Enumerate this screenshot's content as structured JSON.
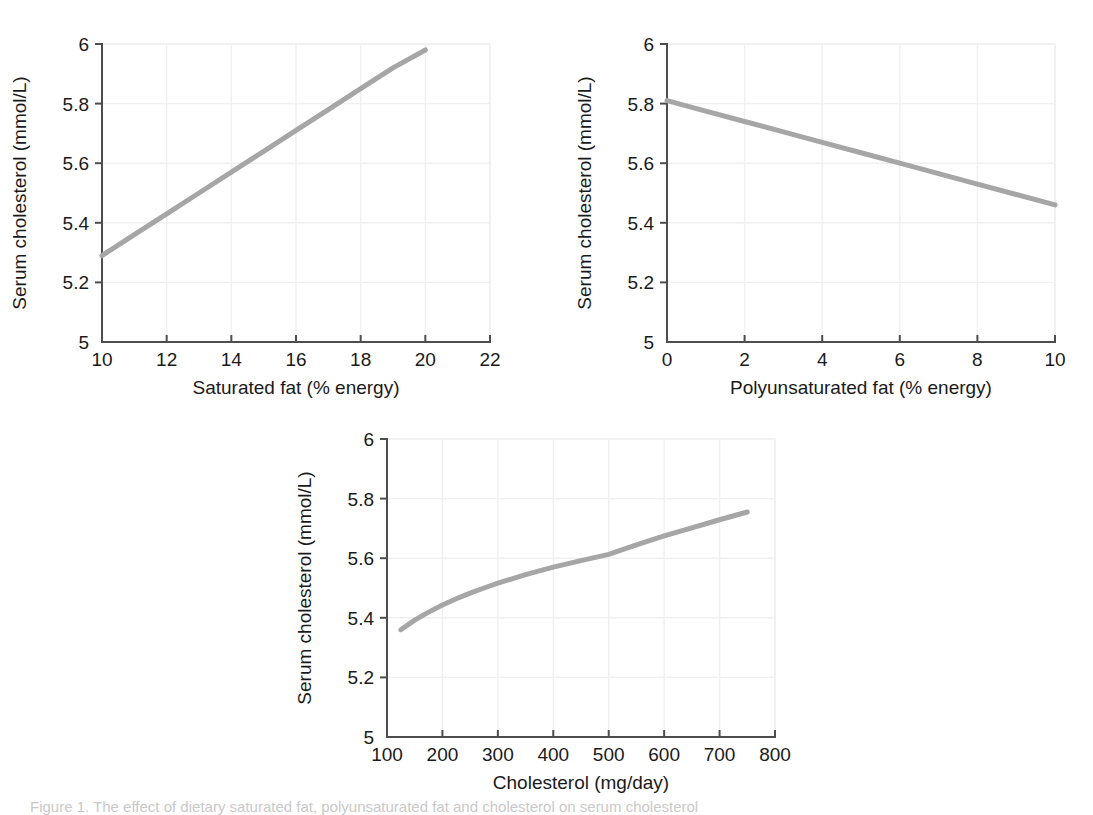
{
  "figure": {
    "background": "#ffffff",
    "line_color": "#a6a6a6",
    "grid_color": "#f0f0f0",
    "axis_color": "#4d4d4d",
    "caption": "Figure 1. The effect of dietary saturated fat, polyunsaturated fat and cholesterol on serum cholesterol"
  },
  "chart_data": [
    {
      "type": "line",
      "panel": "a",
      "title": "",
      "xlabel": "Saturated fat (% energy)",
      "ylabel": "Serum cholesterol (mmol/L)",
      "xlim": [
        10,
        22
      ],
      "ylim": [
        5,
        6
      ],
      "xticks": [
        10,
        12,
        14,
        16,
        18,
        20,
        22
      ],
      "xticklabels": [
        "10",
        "12",
        "14",
        "16",
        "18",
        "20",
        "22"
      ],
      "yticks": [
        5,
        5.2,
        5.4,
        5.6,
        5.8,
        6
      ],
      "yticklabels": [
        "5",
        "5.2",
        "5.4",
        "5.6",
        "5.8",
        "6"
      ],
      "grid": true,
      "legend": "none",
      "x": [
        10,
        11,
        12,
        13,
        14,
        15,
        16,
        17,
        18,
        19,
        20
      ],
      "values": [
        5.29,
        5.36,
        5.43,
        5.5,
        5.57,
        5.64,
        5.71,
        5.78,
        5.85,
        5.92,
        5.98
      ]
    },
    {
      "type": "line",
      "panel": "b",
      "title": "",
      "xlabel": "Polyunsaturated fat (% energy)",
      "ylabel": "Serum cholesterol (mmol/L)",
      "xlim": [
        0,
        10
      ],
      "ylim": [
        5,
        6
      ],
      "xticks": [
        0,
        2,
        4,
        6,
        8,
        10
      ],
      "xticklabels": [
        "0",
        "2",
        "4",
        "6",
        "8",
        "10"
      ],
      "yticks": [
        5,
        5.2,
        5.4,
        5.6,
        5.8,
        6
      ],
      "yticklabels": [
        "5",
        "5.2",
        "5.4",
        "5.6",
        "5.8",
        "6"
      ],
      "grid": true,
      "legend": "none",
      "x": [
        0,
        1,
        2,
        3,
        4,
        5,
        6,
        7,
        8,
        9,
        10
      ],
      "values": [
        5.81,
        5.775,
        5.74,
        5.705,
        5.67,
        5.635,
        5.6,
        5.565,
        5.53,
        5.495,
        5.46
      ]
    },
    {
      "type": "line",
      "panel": "c",
      "title": "",
      "xlabel": "Cholesterol (mg/day)",
      "ylabel": "Serum cholesterol (mmol/L)",
      "xlim": [
        100,
        800
      ],
      "ylim": [
        5,
        6
      ],
      "xticks": [
        100,
        200,
        300,
        400,
        500,
        600,
        700,
        800
      ],
      "xticklabels": [
        "100",
        "200",
        "300",
        "400",
        "500",
        "600",
        "700",
        "800"
      ],
      "yticks": [
        5,
        5.2,
        5.4,
        5.6,
        5.8,
        6
      ],
      "yticklabels": [
        "5",
        "5.2",
        "5.4",
        "5.6",
        "5.8",
        "6"
      ],
      "grid": true,
      "legend": "none",
      "x": [
        125,
        150,
        175,
        200,
        225,
        250,
        275,
        300,
        350,
        400,
        450,
        500,
        550,
        600,
        650,
        700,
        750
      ],
      "values": [
        5.36,
        5.392,
        5.419,
        5.443,
        5.464,
        5.483,
        5.5,
        5.516,
        5.545,
        5.57,
        5.592,
        5.613,
        5.645,
        5.675,
        5.702,
        5.729,
        5.755
      ]
    }
  ]
}
